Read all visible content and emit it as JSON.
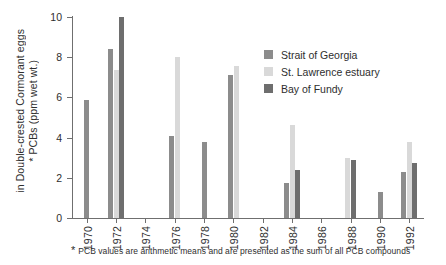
{
  "chart_data": {
    "type": "bar",
    "title": "",
    "subtitle": "",
    "xlabel": "",
    "ylabel": "* PCBs (ppm wet wt.) in Double-crested Cormorant eggs",
    "ylabel_lines": [
      "* PCBs (ppm wet wt.)",
      "in Double-crested Cormorant eggs"
    ],
    "ylim": [
      0,
      10
    ],
    "yticks": [
      0,
      2,
      4,
      6,
      8,
      10
    ],
    "ytick_labels": [
      "0",
      "2",
      "4",
      "6",
      "8",
      "10"
    ],
    "grid": false,
    "legend_position": "top-right",
    "categories": [
      "1970",
      "1972",
      "1974",
      "1976",
      "1978",
      "1980",
      "1982",
      "1984",
      "1986",
      "1988",
      "1990",
      "1992"
    ],
    "series": [
      {
        "name": "Strait of Georgia",
        "color": "#8c8c8c",
        "values": [
          5.85,
          8.4,
          null,
          4.1,
          3.8,
          7.1,
          null,
          1.75,
          null,
          null,
          1.3,
          2.3
        ]
      },
      {
        "name": "St. Lawrence estuary",
        "color": "#d9d9d9",
        "values": [
          null,
          7.35,
          null,
          8.0,
          null,
          7.55,
          null,
          4.65,
          null,
          3.0,
          null,
          3.8
        ]
      },
      {
        "name": "Bay of Fundy",
        "color": "#6e6e6e",
        "values": [
          null,
          10.0,
          null,
          null,
          null,
          null,
          null,
          2.4,
          null,
          2.9,
          null,
          2.75
        ]
      }
    ],
    "footnote_marker": "*",
    "footnote": "PCB values are arithmetic means and are presented as the sum of all PCB compounds"
  },
  "legend": {
    "items": [
      {
        "label": "Strait of Georgia",
        "color": "#8c8c8c"
      },
      {
        "label": "St. Lawrence estuary",
        "color": "#d9d9d9"
      },
      {
        "label": "Bay of Fundy",
        "color": "#6e6e6e"
      }
    ]
  },
  "axis": {
    "axis_color": "#6f6f6f"
  }
}
